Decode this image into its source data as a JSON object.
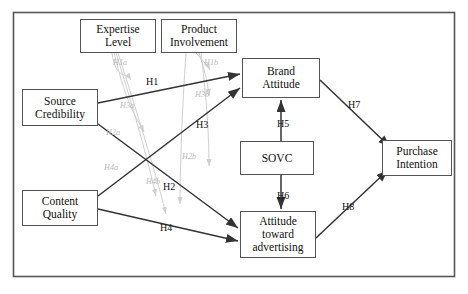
{
  "figure": {
    "frame": {
      "x": 13,
      "y": 12,
      "width": 442,
      "height": 265,
      "stroke": "#555555"
    },
    "colors": {
      "box_border": "#555555",
      "main_arrow": "#333333",
      "moderator_arrow": "#cfcfcf",
      "label_text": "#111111",
      "moderator_text": "#b9b9b9",
      "background": "#ffffff"
    }
  },
  "nodes": [
    {
      "id": "expertise_level",
      "label": "Expertise\nLevel",
      "x": 80,
      "y": 19,
      "w": 76,
      "h": 34,
      "role": "moderator"
    },
    {
      "id": "product_involvement",
      "label": "Product\nInvolvement",
      "x": 161,
      "y": 19,
      "w": 76,
      "h": 34,
      "role": "moderator"
    },
    {
      "id": "source_credibility",
      "label": "Source\nCredibility",
      "x": 22,
      "y": 89,
      "w": 76,
      "h": 37,
      "role": "antecedent"
    },
    {
      "id": "content_quality",
      "label": "Content\nQuality",
      "x": 22,
      "y": 190,
      "w": 76,
      "h": 36,
      "role": "antecedent"
    },
    {
      "id": "brand_attitude",
      "label": "Brand\nAttitude",
      "x": 242,
      "y": 58,
      "w": 78,
      "h": 40,
      "role": "mediator"
    },
    {
      "id": "sovc",
      "label": "SOVC",
      "x": 240,
      "y": 141,
      "w": 74,
      "h": 34,
      "role": "mediator"
    },
    {
      "id": "attitude_toward_advertising",
      "label": "Attitude\ntoward\nadvertising",
      "x": 240,
      "y": 211,
      "w": 76,
      "h": 47,
      "role": "mediator"
    },
    {
      "id": "purchase_intention",
      "label": "Purchase\nIntention",
      "x": 382,
      "y": 140,
      "w": 70,
      "h": 36,
      "role": "outcome"
    }
  ],
  "edges": [
    {
      "id": "H1",
      "label": "H1",
      "from": "source_credibility",
      "to": "brand_attitude",
      "label_x": 146,
      "label_y": 76,
      "type": "main"
    },
    {
      "id": "H3",
      "label": "H3",
      "from": "source_credibility",
      "to": "attitude_toward_advertising",
      "label_x": 196,
      "label_y": 119,
      "type": "main"
    },
    {
      "id": "H2",
      "label": "H2",
      "from": "content_quality",
      "to": "brand_attitude",
      "label_x": 163,
      "label_y": 181,
      "type": "main"
    },
    {
      "id": "H4",
      "label": "H4",
      "from": "content_quality",
      "to": "attitude_toward_advertising",
      "label_x": 160,
      "label_y": 222,
      "type": "main"
    },
    {
      "id": "H5",
      "label": "H5",
      "from": "sovc",
      "to": "brand_attitude",
      "label_x": 277,
      "label_y": 118,
      "type": "main"
    },
    {
      "id": "H6",
      "label": "H6",
      "from": "sovc",
      "to": "attitude_toward_advertising",
      "label_x": 277,
      "label_y": 190,
      "type": "main"
    },
    {
      "id": "H7",
      "label": "H7",
      "from": "brand_attitude",
      "to": "purchase_intention",
      "label_x": 348,
      "label_y": 99,
      "type": "main"
    },
    {
      "id": "H8",
      "label": "H8",
      "from": "attitude_toward_advertising",
      "to": "purchase_intention",
      "label_x": 342,
      "label_y": 201,
      "type": "main"
    }
  ],
  "moderator_edges": [
    {
      "id": "H1a",
      "label": "H1a",
      "from": "expertise_level",
      "moderates": "H1",
      "label_x": 113,
      "label_y": 58
    },
    {
      "id": "H1b",
      "label": "H1b",
      "from": "product_involvement",
      "moderates": "H1",
      "label_x": 204,
      "label_y": 58
    },
    {
      "id": "H3a",
      "label": "H3a",
      "from": "expertise_level",
      "moderates": "H3",
      "label_x": 120,
      "label_y": 101
    },
    {
      "id": "H3b",
      "label": "H3b",
      "from": "product_involvement",
      "moderates": "H3",
      "label_x": 195,
      "label_y": 90
    },
    {
      "id": "H2a",
      "label": "H2a",
      "from": "expertise_level",
      "moderates": "H2",
      "label_x": 106,
      "label_y": 128
    },
    {
      "id": "H2b",
      "label": "H2b",
      "from": "product_involvement",
      "moderates": "H2",
      "label_x": 182,
      "label_y": 152
    },
    {
      "id": "H4a",
      "label": "H4a",
      "from": "expertise_level",
      "moderates": "H4",
      "label_x": 104,
      "label_y": 163
    },
    {
      "id": "H4b",
      "label": "H4b",
      "from": "product_involvement",
      "moderates": "H4",
      "label_x": 146,
      "label_y": 177
    }
  ]
}
